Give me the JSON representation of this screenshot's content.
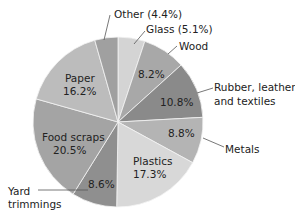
{
  "chart_data": {
    "type": "pie",
    "title": "",
    "start_angle_deg": 0,
    "direction": "clockwise",
    "slices": [
      {
        "name": "Glass",
        "value": 5.1,
        "label": "Glass (5.1%)",
        "inside_label": "",
        "color": "#d4d4d4"
      },
      {
        "name": "Wood",
        "value": 8.2,
        "label": "Wood",
        "inside_label": "8.2%",
        "color": "#a8a8a8"
      },
      {
        "name": "Rubber, leather, and textiles",
        "value": 10.8,
        "label": "Rubber, leather, and textiles",
        "inside_label": "10.8%",
        "color": "#8a8a8a"
      },
      {
        "name": "Metals",
        "value": 8.8,
        "label": "Metals",
        "inside_label": "8.8%",
        "color": "#b4b4b4"
      },
      {
        "name": "Plastics",
        "value": 17.3,
        "label": "",
        "inside_label": "Plastics\n17.3%",
        "color": "#d8d8d8"
      },
      {
        "name": "Yard trimmings",
        "value": 8.6,
        "label": "Yard trimmings",
        "inside_label": "8.6%",
        "color": "#8f8f8f"
      },
      {
        "name": "Food scraps",
        "value": 20.5,
        "label": "",
        "inside_label": "Food scraps\n20.5%",
        "color": "#a4a4a4"
      },
      {
        "name": "Paper",
        "value": 16.2,
        "label": "",
        "inside_label": "Paper\n16.2%",
        "color": "#bcbcbc"
      },
      {
        "name": "Other",
        "value": 4.4,
        "label": "Other (4.4%)",
        "inside_label": "",
        "color": "#a0a0a0"
      }
    ]
  },
  "labels": {
    "other": "Other (4.4%)",
    "glass": "Glass (5.1%)",
    "wood": "Wood",
    "rubber_line1": "Rubber, leather,",
    "rubber_line2": "and textiles",
    "metals": "Metals",
    "yard_line1": "Yard",
    "yard_line2": "trimmings",
    "paper_name": "Paper",
    "paper_pct": "16.2%",
    "food_name": "Food scraps",
    "food_pct": "20.5%",
    "plastics_name": "Plastics",
    "plastics_pct": "17.3%",
    "wood_pct": "8.2%",
    "rubber_pct": "10.8%",
    "metals_pct": "8.8%",
    "yard_pct": "8.6%"
  }
}
